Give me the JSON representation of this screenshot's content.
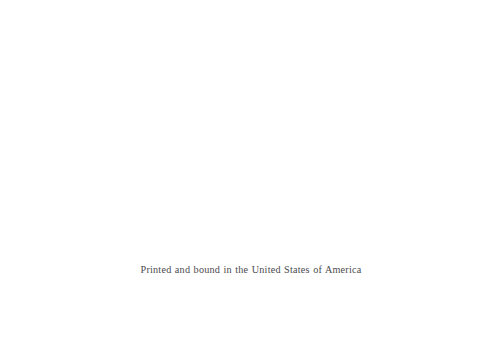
{
  "page": {
    "kind": "colophon-page",
    "background_color": "#ffffff",
    "text_color": "#3a3a40",
    "width": 485,
    "height": 351
  },
  "imprint": {
    "line": "Printed and bound in the United States of America"
  }
}
